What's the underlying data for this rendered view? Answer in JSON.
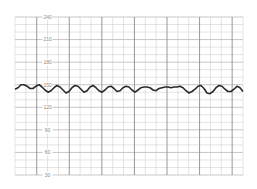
{
  "chart_data": {
    "type": "line",
    "title": "",
    "xlabel": "",
    "ylabel": "",
    "ylim": [
      30,
      240
    ],
    "yticks": [
      240,
      210,
      180,
      150,
      120,
      90,
      60,
      30
    ],
    "grid": true,
    "legend": null,
    "series": [
      {
        "name": "trace",
        "color": "#2a2a2a",
        "x": [
          0,
          3,
          6,
          9,
          12,
          15,
          18,
          21,
          24,
          27,
          30,
          33,
          36,
          39,
          42,
          45,
          48,
          51,
          54,
          57,
          60,
          63,
          66,
          69,
          72,
          75,
          78,
          81,
          84,
          87,
          90,
          93,
          96,
          99,
          102,
          105,
          108,
          111,
          114,
          117,
          120,
          123,
          126,
          129,
          132,
          135,
          138,
          141,
          144,
          147,
          150,
          153,
          156,
          159,
          162,
          165,
          168,
          171,
          174,
          177,
          180,
          183,
          186,
          189,
          192,
          195,
          198,
          201,
          204,
          207,
          210,
          213,
          216,
          219,
          222,
          225,
          228
        ],
        "values": [
          144,
          146,
          150,
          150,
          148,
          145,
          145,
          148,
          150,
          147,
          143,
          140,
          142,
          146,
          149,
          147,
          143,
          139,
          141,
          146,
          149,
          148,
          144,
          140,
          142,
          147,
          149,
          146,
          142,
          140,
          143,
          147,
          148,
          145,
          141,
          142,
          146,
          148,
          147,
          143,
          140,
          143,
          146,
          147,
          147,
          146,
          143,
          142,
          145,
          146,
          147,
          147,
          146,
          147,
          147,
          148,
          146,
          142,
          139,
          141,
          144,
          148,
          149,
          145,
          139,
          138,
          141,
          146,
          149,
          148,
          144,
          141,
          141,
          144,
          148,
          146,
          141
        ]
      }
    ]
  },
  "colors": {
    "grid_light": "#c8c8c8",
    "grid_dark": "#8c8c8c",
    "trace": "#2a2a2a",
    "label": "#8a8a8a"
  }
}
